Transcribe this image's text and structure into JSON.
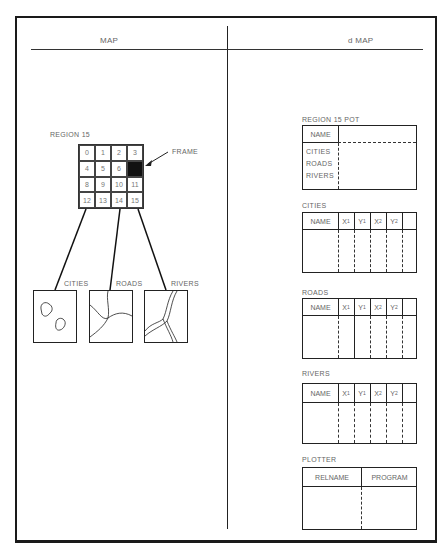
{
  "header": {
    "left_title": "MAP",
    "right_title": "d MAP"
  },
  "map": {
    "region_label": "REGION 15",
    "frame_label": "FRAME",
    "grid_cells": [
      "0",
      "1",
      "2",
      "3",
      "4",
      "5",
      "6",
      "",
      "8",
      "9",
      "10",
      "11",
      "12",
      "13",
      "14",
      "15"
    ],
    "highlighted_cell_index": 7,
    "layers": [
      {
        "label": "CITIES",
        "icon": "city-blobs-icon"
      },
      {
        "label": "ROADS",
        "icon": "road-lines-icon"
      },
      {
        "label": "RIVERS",
        "icon": "river-lines-icon"
      }
    ]
  },
  "dmap": {
    "region_pot": {
      "title": "REGION 15 POT",
      "name_label": "NAME",
      "rows": [
        "CITIES",
        "ROADS",
        "RIVERS"
      ]
    },
    "tables": [
      {
        "title": "CITIES",
        "columns": [
          "NAME",
          "X1",
          "Y1",
          "X2",
          "Y2",
          ""
        ]
      },
      {
        "title": "ROADS",
        "columns": [
          "NAME",
          "X1",
          "Y1",
          "X2",
          "Y2",
          ""
        ]
      },
      {
        "title": "RIVERS",
        "columns": [
          "NAME",
          "X1",
          "Y1",
          "X2",
          "Y2",
          ""
        ]
      }
    ],
    "plotter": {
      "title": "PLOTTER",
      "columns": [
        "RELNAME",
        "PROGRAM"
      ]
    }
  }
}
